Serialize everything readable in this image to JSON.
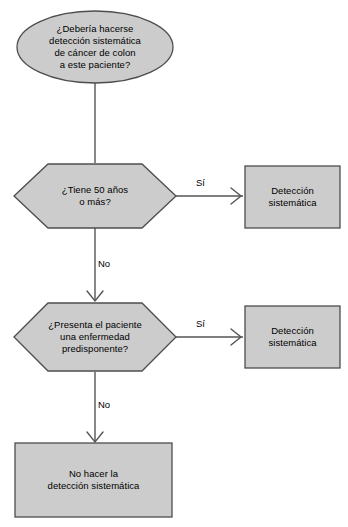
{
  "diagram": {
    "language": "es",
    "colors": {
      "shape_fill": "#cccccc",
      "shape_stroke": "#4d4d4d",
      "connector": "#555555",
      "text": "#000000",
      "background": "#ffffff"
    }
  },
  "nodes": {
    "start": {
      "shape": "ellipse",
      "text": "¿Debería hacerse\ndetección sistemática\nde cáncer de colon\na este paciente?",
      "lines": [
        "¿Debería hacerse",
        "detección sistemática",
        "de cáncer de colon",
        "a este paciente?"
      ]
    },
    "decision_age": {
      "shape": "hexagon",
      "text": "¿Tiene 50 años\no más?",
      "lines": [
        "¿Tiene 50 años",
        "o más?"
      ]
    },
    "decision_disease": {
      "shape": "hexagon",
      "text": "¿Presenta el paciente\nuna enfermedad\npredisponente?",
      "lines": [
        "¿Presenta el paciente",
        "una enfermedad",
        "predisponente?"
      ]
    },
    "outcome_screen_age": {
      "shape": "rectangle",
      "text": "Detección\nsistemática",
      "lines": [
        "Detección",
        "sistemática"
      ]
    },
    "outcome_screen_disease": {
      "shape": "rectangle",
      "text": "Detección\nsistemática",
      "lines": [
        "Detección",
        "sistemática"
      ]
    },
    "outcome_no_screen": {
      "shape": "rectangle",
      "text": "No hacer la\ndetección sistemática",
      "lines": [
        "No hacer la",
        "detección sistemática"
      ]
    }
  },
  "edges": {
    "start_to_age": {
      "label": ""
    },
    "age_yes": {
      "label": "Sí"
    },
    "age_no": {
      "label": "No"
    },
    "disease_yes": {
      "label": "Sí"
    },
    "disease_no": {
      "label": "No"
    }
  }
}
